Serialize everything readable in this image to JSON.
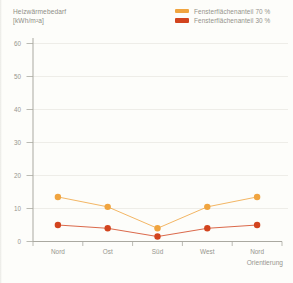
{
  "figure": {
    "title_line1": "Heizwärmebedarf",
    "title_line2": "[kWh/m²a]"
  },
  "chart_data": {
    "type": "line",
    "title": "Heizwärmebedarf [kWh/m²a]",
    "xlabel": "Orientierung",
    "ylabel": "Heizwärmebedarf [kWh/m²a]",
    "categories": [
      "Nord",
      "Ost",
      "Süd",
      "West",
      "Nord"
    ],
    "series": [
      {
        "name": "Fensterflächenanteil 70 %",
        "color": "#f0a43f",
        "values": [
          13.5,
          10.5,
          4,
          10.5,
          13.5
        ]
      },
      {
        "name": "Fensterflächenanteil 30 %",
        "color": "#d2441e",
        "values": [
          5,
          4,
          1.5,
          4,
          5
        ]
      }
    ],
    "ylim": [
      0,
      60
    ],
    "y_ticks": [
      0,
      10,
      20,
      30,
      40,
      50,
      60
    ],
    "grid": true,
    "legend_position": "top-right"
  },
  "colors": {
    "background": "#fdfdfa",
    "axis": "#aaa9a1",
    "grid": "#eae9e3",
    "text": "#94938b"
  }
}
